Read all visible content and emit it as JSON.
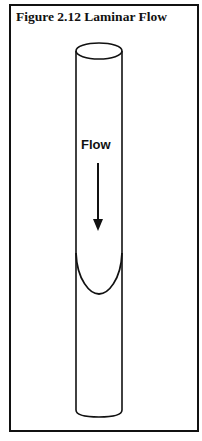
{
  "figure": {
    "title": "Figure 2.12  Laminar Flow",
    "flow_label": "Flow",
    "colors": {
      "stroke": "#111111",
      "background": "#ffffff"
    }
  }
}
